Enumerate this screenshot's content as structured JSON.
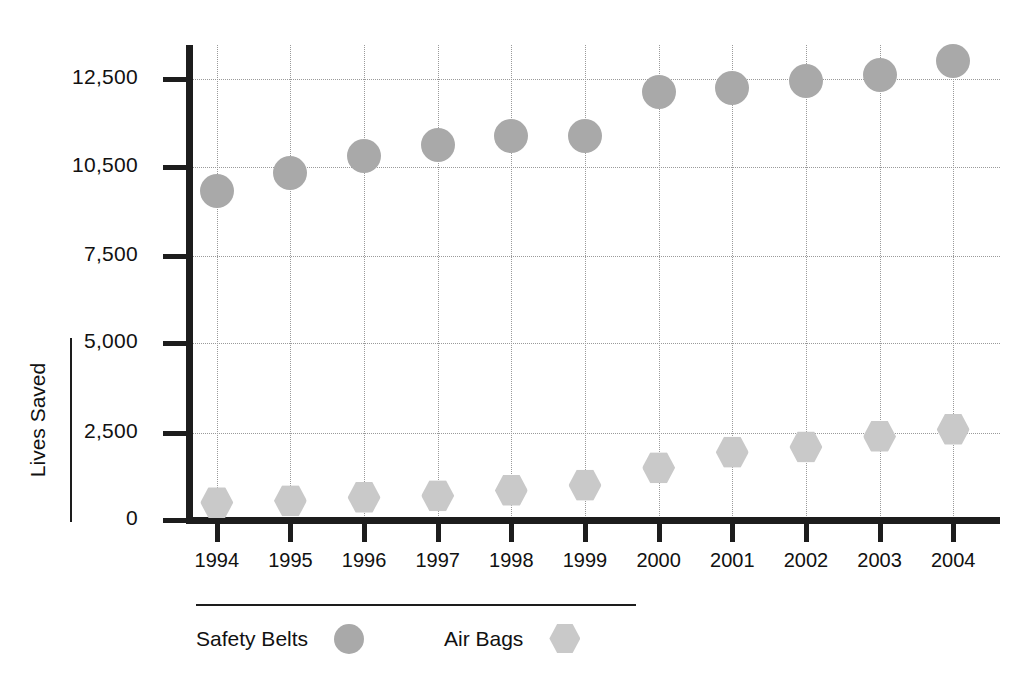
{
  "chart_data": {
    "type": "scatter",
    "title": "",
    "xlabel": "",
    "ylabel": "Lives Saved",
    "grid": true,
    "legend_position": "bottom",
    "categories": [
      "1994",
      "1995",
      "1996",
      "1997",
      "1998",
      "1999",
      "2000",
      "2001",
      "2002",
      "2003",
      "2004"
    ],
    "y_tick_labels": [
      "0",
      "2,500",
      "5,000",
      "7,500",
      "10,500",
      "12,500"
    ],
    "y_tick_values": [
      0,
      2500,
      5000,
      7500,
      10500,
      12500
    ],
    "ylim": [
      0,
      13500
    ],
    "series": [
      {
        "name": "Safety Belts",
        "marker": "circle",
        "color": "#a9a9a9",
        "values": [
          9700,
          10300,
          10750,
          11000,
          11200,
          11200,
          12200,
          12300,
          12450,
          12600,
          12900
        ]
      },
      {
        "name": "Air Bags",
        "marker": "hexagon",
        "color": "#c9c9c9",
        "values": [
          500,
          550,
          650,
          700,
          850,
          1000,
          1500,
          1950,
          2100,
          2400,
          2600
        ]
      }
    ]
  },
  "axis": {
    "y_title": "Lives Saved"
  },
  "legend": {
    "items": [
      {
        "label": "Safety Belts",
        "marker": "circle"
      },
      {
        "label": "Air Bags",
        "marker": "hexagon"
      }
    ]
  }
}
